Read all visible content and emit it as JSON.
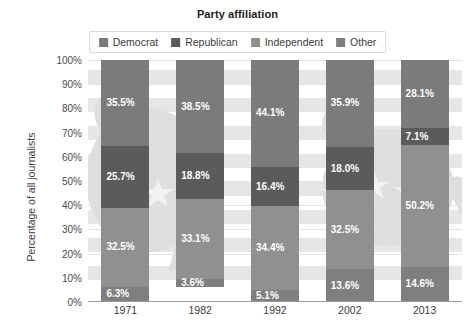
{
  "chart_data": {
    "type": "bar",
    "subtype": "stacked-bar-100-percent",
    "title": "Party affiliation",
    "xlabel": "",
    "ylabel": "Percentage of all journalists",
    "categories": [
      "1971",
      "1982",
      "1992",
      "2002",
      "2013"
    ],
    "ylim": [
      0,
      100
    ],
    "ytick_labels": [
      "0%",
      "10%",
      "20%",
      "30%",
      "40%",
      "50%",
      "60%",
      "70%",
      "80%",
      "90%",
      "100%"
    ],
    "ytick_values": [
      0,
      10,
      20,
      30,
      40,
      50,
      60,
      70,
      80,
      90,
      100
    ],
    "grid": true,
    "legend_position": "top-center",
    "stack_order_top_to_bottom": [
      "Democrat",
      "Republican",
      "Independent",
      "Other"
    ],
    "series": [
      {
        "name": "Democrat",
        "color": "#7b7b7b",
        "values": [
          35.5,
          38.5,
          44.1,
          35.9,
          28.1
        ],
        "labels": [
          "35.5%",
          "38.5%",
          "44.1%",
          "35.9%",
          "28.1%"
        ]
      },
      {
        "name": "Republican",
        "color": "#5b5b5b",
        "values": [
          25.7,
          18.8,
          16.4,
          18.0,
          7.1
        ],
        "labels": [
          "25.7%",
          "18.8%",
          "16.4%",
          "18.0%",
          "7.1%"
        ]
      },
      {
        "name": "Independent",
        "color": "#909090",
        "values": [
          32.5,
          33.1,
          34.4,
          32.5,
          50.2
        ],
        "labels": [
          "32.5%",
          "33.1%",
          "34.4%",
          "32.5%",
          "50.2%"
        ]
      },
      {
        "name": "Other",
        "color": "#7f7f7f",
        "values": [
          6.3,
          3.6,
          5.1,
          13.6,
          14.6
        ],
        "labels": [
          "6.3%",
          "3.6%",
          "5.1%",
          "13.6%",
          "14.6%"
        ]
      }
    ]
  },
  "legend": {
    "items": [
      {
        "label": "Democrat",
        "color": "#7b7b7b"
      },
      {
        "label": "Republican",
        "color": "#5b5b5b"
      },
      {
        "label": "Independent",
        "color": "#909090"
      },
      {
        "label": "Other",
        "color": "#7f7f7f"
      }
    ]
  },
  "colors": {
    "background": "#ffffff",
    "grid": "#e3e3e3",
    "axis": "#9a9a9a",
    "title_text": "#1d1d1d",
    "tick_text": "#3c3c3c",
    "label_text": "#ffffff"
  }
}
